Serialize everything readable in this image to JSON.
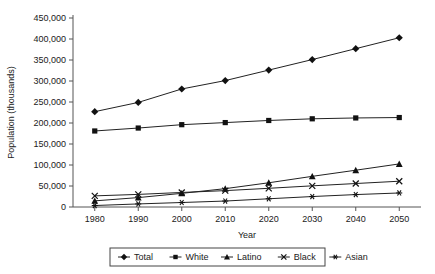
{
  "chart_data": {
    "type": "line",
    "title": "",
    "xlabel": "Year",
    "ylabel": "Population (thousands)",
    "x": [
      1980,
      1990,
      2000,
      2010,
      2020,
      2030,
      2040,
      2050
    ],
    "xlim": [
      1975,
      2055
    ],
    "ylim": [
      0,
      450000
    ],
    "xticks": [
      "1980",
      "1990",
      "2000",
      "2010",
      "2020",
      "2030",
      "2040",
      "2050"
    ],
    "yticks": [
      "0",
      "50,000",
      "100,000",
      "150,000",
      "200,000",
      "250,000",
      "300,000",
      "350,000",
      "400,000",
      "450,000"
    ],
    "ytick_values": [
      0,
      50000,
      100000,
      150000,
      200000,
      250000,
      300000,
      350000,
      400000,
      450000
    ],
    "grid": false,
    "legend_position": "bottom",
    "series": [
      {
        "name": "Total",
        "marker": "diamond",
        "values": [
          227000,
          249000,
          281000,
          301000,
          326000,
          351000,
          377000,
          403000
        ]
      },
      {
        "name": "White",
        "marker": "square",
        "values": [
          181000,
          188000,
          196000,
          201000,
          206000,
          210000,
          212000,
          213000
        ]
      },
      {
        "name": "Latino",
        "marker": "triangle",
        "values": [
          14600,
          22400,
          32500,
          43700,
          57700,
          73000,
          87600,
          102600
        ]
      },
      {
        "name": "Black",
        "marker": "cross",
        "values": [
          26500,
          30000,
          34600,
          39000,
          44500,
          50400,
          55900,
          61400
        ]
      },
      {
        "name": "Asian",
        "marker": "star",
        "values": [
          3500,
          7300,
          10700,
          14200,
          19600,
          24900,
          29600,
          33400
        ]
      }
    ]
  }
}
